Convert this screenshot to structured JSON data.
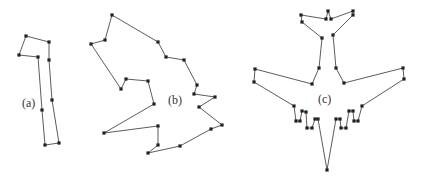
{
  "figure": {
    "shapes": [
      {
        "id": "a",
        "label": "(a)",
        "label_pos": [
          22,
          107
        ],
        "vertices": [
          [
            26,
            36
          ],
          [
            49,
            42
          ],
          [
            49,
            60
          ],
          [
            52,
            100
          ],
          [
            59,
            143
          ],
          [
            45,
            145
          ],
          [
            42,
            110
          ],
          [
            38,
            57
          ],
          [
            19,
            55
          ]
        ]
      },
      {
        "id": "b",
        "label": "(b)",
        "label_pos": [
          168,
          104
        ],
        "vertices": [
          [
            112,
            15
          ],
          [
            158,
            42
          ],
          [
            166,
            57
          ],
          [
            184,
            60
          ],
          [
            197,
            85
          ],
          [
            194,
            94
          ],
          [
            215,
            97
          ],
          [
            199,
            107
          ],
          [
            222,
            125
          ],
          [
            211,
            129
          ],
          [
            180,
            146
          ],
          [
            148,
            153
          ],
          [
            158,
            145
          ],
          [
            158,
            126
          ],
          [
            104,
            133
          ],
          [
            154,
            104
          ],
          [
            148,
            81
          ],
          [
            126,
            79
          ],
          [
            121,
            89
          ],
          [
            91,
            44
          ],
          [
            105,
            40
          ]
        ]
      },
      {
        "id": "c",
        "label": "(c)",
        "label_pos": [
          318,
          103
        ],
        "vertices": [
          [
            328,
            11
          ],
          [
            331,
            19
          ],
          [
            353,
            11
          ],
          [
            353,
            15
          ],
          [
            333,
            35
          ],
          [
            336,
            68
          ],
          [
            344,
            83
          ],
          [
            403,
            68
          ],
          [
            404,
            79
          ],
          [
            362,
            106
          ],
          [
            358,
            121
          ],
          [
            354,
            121
          ],
          [
            353,
            111
          ],
          [
            349,
            111
          ],
          [
            346,
            128
          ],
          [
            341,
            128
          ],
          [
            340,
            119
          ],
          [
            336,
            119
          ],
          [
            327,
            170
          ],
          [
            318,
            119
          ],
          [
            315,
            119
          ],
          [
            312,
            128
          ],
          [
            307,
            128
          ],
          [
            306,
            112
          ],
          [
            302,
            111
          ],
          [
            300,
            121
          ],
          [
            296,
            121
          ],
          [
            294,
            106
          ],
          [
            254,
            82
          ],
          [
            255,
            69
          ],
          [
            312,
            84
          ],
          [
            319,
            68
          ],
          [
            322,
            38
          ],
          [
            302,
            22
          ],
          [
            301,
            15
          ],
          [
            326,
            19
          ]
        ]
      }
    ],
    "colors": {
      "stroke": "#4a4a4a",
      "vertex": "#222222",
      "background": "#ffffff"
    }
  }
}
